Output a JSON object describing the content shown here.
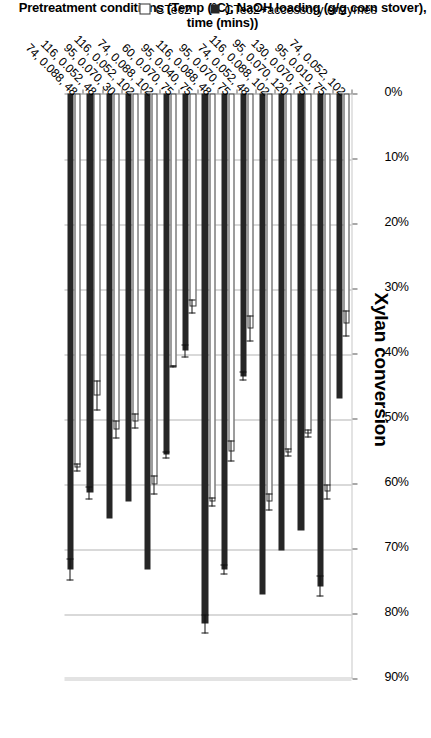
{
  "chart_data": {
    "type": "bar",
    "orientation": "horizontal",
    "title": "Xylan conversion",
    "xlabel": "",
    "ylabel": "Pretreatment conditions (Temp (°C), NaOH loading (g/g corn stover), time (mins))",
    "xlim": [
      0,
      90
    ],
    "tick_labels": [
      "0%",
      "10%",
      "20%",
      "30%",
      "40%",
      "50%",
      "60%",
      "70%",
      "80%",
      "90%"
    ],
    "tick_values": [
      0,
      10,
      20,
      30,
      40,
      50,
      60,
      70,
      80,
      90
    ],
    "grid": true,
    "legend_position": "left",
    "categories": [
      "74, 0.052, 102",
      "95, 0.010, 75",
      "130, 0.070, 75",
      "95, 0.070, 120",
      "116, 0.088, 102",
      "74, 0.052, 48",
      "95, 0.070, 75",
      "116, 0.088, 48",
      "95, 0.040, 75",
      "60, 0.070, 75",
      "74, 0.088, 102",
      "116, 0.052, 102",
      "95, 0.070, 30",
      "116, 0.052, 48",
      "74, 0.088, 48"
    ],
    "series": [
      {
        "name": "CTec2",
        "style": "open",
        "values": [
          35.4,
          61.3,
          52.3,
          55.2,
          62.8,
          36.1,
          55.0,
          62.8,
          32.8,
          42.0,
          60.2,
          50.4,
          51.7,
          46.5,
          57.5
        ],
        "errors": [
          2.0,
          1.2,
          0.6,
          0.6,
          1.3,
          2.0,
          1.6,
          0.7,
          1.1,
          0.2,
          1.5,
          1.2,
          1.4,
          2.3,
          0.6
        ]
      },
      {
        "name": "CTec2+accessory enzymes",
        "style": "filled",
        "values": [
          46.9,
          75.8,
          67.3,
          70.3,
          77.1,
          43.5,
          73.2,
          81.6,
          39.6,
          55.6,
          73.2,
          62.8,
          65.4,
          61.4,
          73.2
        ],
        "errors": [
          0.0,
          1.6,
          0.0,
          0.0,
          0.0,
          0.7,
          0.8,
          1.5,
          1.0,
          0.5,
          0.0,
          0.0,
          0.0,
          1.0,
          1.7
        ]
      }
    ]
  },
  "legend": {
    "items": [
      {
        "label": "CTec2",
        "style": "open"
      },
      {
        "label": "CTec2+accessory enzymes",
        "style": "filled"
      }
    ]
  },
  "axis_title": "Pretreatment conditions (Temp (°C), NaOH loading (g/g corn stover), time (mins))",
  "colors": {
    "filled_bar": "#262626",
    "open_bar_outline": "#3a3a3a",
    "gridline": "#b4b4b4",
    "text": "#000000",
    "background": "#ffffff"
  }
}
